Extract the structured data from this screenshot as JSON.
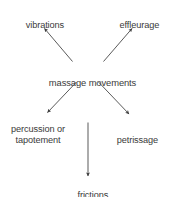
{
  "diagram": {
    "title": "massage movements",
    "type": "radial-arrow-diagram",
    "background_color": "#ffffff",
    "text_color": "#3a3a3a",
    "arrow_color": "#3c3c3c",
    "center_node": {
      "id": "massage-movements",
      "label": "massage movements"
    },
    "nodes": [
      {
        "id": "vibrations",
        "label": "vibrations",
        "position": "top-left"
      },
      {
        "id": "effleurage",
        "label": "effleurage",
        "position": "top-right"
      },
      {
        "id": "percussion-or-tapotement",
        "label_line1": "percussion or",
        "label_line2": "tapotement",
        "position": "bottom-left"
      },
      {
        "id": "petrissage",
        "label": "petrissage",
        "position": "bottom-right"
      },
      {
        "id": "frictions",
        "label": "frictions",
        "position": "bottom-center"
      }
    ],
    "edges": [
      {
        "from": "massage-movements",
        "to": "vibrations",
        "direction": "up-left"
      },
      {
        "from": "massage-movements",
        "to": "effleurage",
        "direction": "up-right"
      },
      {
        "from": "massage-movements",
        "to": "percussion-or-tapotement",
        "direction": "down-left"
      },
      {
        "from": "massage-movements",
        "to": "petrissage",
        "direction": "down-right"
      },
      {
        "from": "massage-movements",
        "to": "frictions",
        "direction": "down"
      }
    ]
  }
}
